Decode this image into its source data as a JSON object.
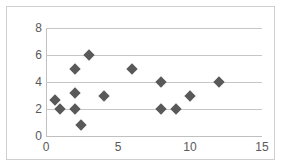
{
  "chart_data": {
    "type": "scatter",
    "title": "",
    "subtitle": "",
    "xlabel": "",
    "ylabel": "",
    "xlim": [
      0,
      15
    ],
    "ylim": [
      0,
      8
    ],
    "xticks": [
      "0",
      "5",
      "10",
      "15"
    ],
    "xtick_values": [
      0,
      5,
      10,
      15
    ],
    "yticks": [
      "0",
      "2",
      "4",
      "6",
      "8"
    ],
    "ytick_values": [
      0,
      2,
      4,
      6,
      8
    ],
    "grid": "horizontal",
    "legend": "none",
    "marker": "diamond",
    "marker_color": "#595959",
    "gridline_color": "#c6c6c6",
    "frame_color": "#cfcfcf",
    "series": [
      {
        "name": "series1",
        "points": [
          {
            "x": 0.6,
            "y": 2.7
          },
          {
            "x": 1.0,
            "y": 2.0
          },
          {
            "x": 2.0,
            "y": 5.0
          },
          {
            "x": 2.0,
            "y": 3.2
          },
          {
            "x": 2.0,
            "y": 2.0
          },
          {
            "x": 2.4,
            "y": 0.8
          },
          {
            "x": 3.0,
            "y": 6.0
          },
          {
            "x": 4.0,
            "y": 3.0
          },
          {
            "x": 6.0,
            "y": 5.0
          },
          {
            "x": 8.0,
            "y": 4.0
          },
          {
            "x": 8.0,
            "y": 2.0
          },
          {
            "x": 9.0,
            "y": 2.0
          },
          {
            "x": 10.0,
            "y": 3.0
          },
          {
            "x": 12.0,
            "y": 4.0
          }
        ]
      }
    ]
  }
}
